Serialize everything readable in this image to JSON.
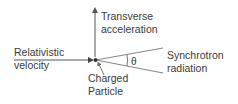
{
  "diagram": {
    "labels": {
      "velocity": [
        "Relativistic",
        "velocity"
      ],
      "acceleration": [
        "Transverse",
        "acceleration"
      ],
      "radiation": [
        "Synchrotron",
        "radiation"
      ],
      "particle": [
        "Charged",
        "Particle"
      ],
      "angle": "θ"
    },
    "colors": {
      "line": "#555555",
      "text": "#3a3a3a",
      "particle": "#333333"
    }
  }
}
